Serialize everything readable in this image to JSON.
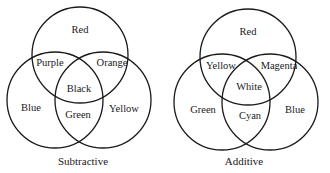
{
  "diagrams": [
    {
      "name": "subtractive",
      "caption": "Subtractive",
      "circles": {
        "top": "Red",
        "left": "Blue",
        "right": "Yellow"
      },
      "overlaps": {
        "top_left": "Purple",
        "top_right": "Orange",
        "bottom": "Green",
        "center": "Black"
      }
    },
    {
      "name": "additive",
      "caption": "Additive",
      "circles": {
        "top": "Red",
        "left": "Green",
        "right": "Blue"
      },
      "overlaps": {
        "top_left": "Yellow",
        "top_right": "Magenta",
        "bottom": "Cyan",
        "center": "White"
      }
    }
  ]
}
